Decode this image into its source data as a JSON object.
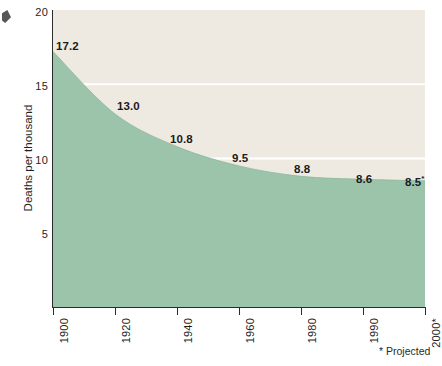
{
  "chart_data": {
    "type": "area",
    "title": "",
    "subtitle": "",
    "xlabel": "",
    "ylabel": "Deaths per thousand",
    "categories": [
      "1900",
      "1920",
      "1940",
      "1960",
      "1980",
      "1990",
      "2000*"
    ],
    "x": [
      1900,
      1920,
      1940,
      1960,
      1980,
      1990,
      2000
    ],
    "values": [
      17.2,
      13.0,
      10.8,
      9.5,
      8.8,
      8.6,
      8.5
    ],
    "point_labels": [
      "17.2",
      "13.0",
      "10.8",
      "9.5",
      "8.8",
      "8.6",
      "8.5*"
    ],
    "series": [
      {
        "name": "Deaths per thousand",
        "values": [
          17.2,
          13.0,
          10.8,
          9.5,
          8.8,
          8.6,
          8.5
        ]
      }
    ],
    "ylim": [
      0,
      20
    ],
    "yticks": [
      5,
      10,
      15,
      20
    ],
    "ytick_labels": [
      "5",
      "10",
      "15",
      "20"
    ],
    "xtick_labels": [
      "1900",
      "1920",
      "1940",
      "1960",
      "1980",
      "1990",
      "2000*"
    ],
    "grid": "horizontal-white-at-10-and-15",
    "legend": "none",
    "annotations": [
      "* Projected"
    ],
    "colors": {
      "area_fill": "#9cc4ab",
      "panel_background": "#efeae1",
      "gridline": "#ffffff",
      "axis": "#2b2b2b",
      "text": "#1f1f1f"
    }
  },
  "axis": {
    "y_title": "Deaths per thousand",
    "y_labels": [
      "20",
      "15",
      "10",
      "5"
    ],
    "x_labels": [
      "1900",
      "1920",
      "1940",
      "1960",
      "1980",
      "1990",
      "2000*"
    ]
  },
  "labels": {
    "p0": "17.2",
    "p1": "13.0",
    "p2": "10.8",
    "p3": "9.5",
    "p4": "8.8",
    "p5": "8.6",
    "p6_value": "8.5",
    "p6_mark": "*"
  },
  "footnote": {
    "mark": "*",
    "text": "Projected",
    "full": "* Projected"
  }
}
